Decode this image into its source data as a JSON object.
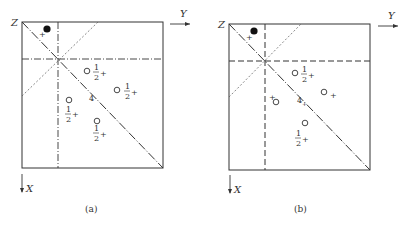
{
  "figure": {
    "panels": [
      {
        "id": "a",
        "caption": "(a)",
        "axis_labels": {
          "z": "Z",
          "y": "Y",
          "x": "X"
        },
        "symmetry_label": "4",
        "filled_atom": {
          "sign": "+"
        },
        "open_atoms": [
          {
            "height": "1/2",
            "sign": "+",
            "num": "1",
            "den": "2",
            "plus": "+"
          },
          {
            "height": "1/2",
            "sign": "+",
            "num": "1",
            "den": "2",
            "plus": "+"
          },
          {
            "height": "1/2",
            "sign": "+",
            "num": "1",
            "den": "2",
            "plus": "+"
          },
          {
            "height": "1/2",
            "sign": "+",
            "num": "1",
            "den": "2",
            "plus": "+"
          }
        ]
      },
      {
        "id": "b",
        "caption": "(b)",
        "axis_labels": {
          "z": "Z",
          "y": "Y",
          "x": "X"
        },
        "symmetry_label": "4",
        "symmetry_sub": "+",
        "filled_atom": {
          "sign": "+"
        },
        "open_atoms": [
          {
            "height": "1/2",
            "sign": "+",
            "num": "1",
            "den": "2",
            "plus": "+"
          },
          {
            "height": "",
            "sign": "+",
            "plus": "+"
          },
          {
            "height": "",
            "sign": "+",
            "plus": "+"
          },
          {
            "height": "1/2",
            "sign": "+",
            "num": "1",
            "den": "2",
            "plus": "+"
          }
        ]
      }
    ]
  }
}
